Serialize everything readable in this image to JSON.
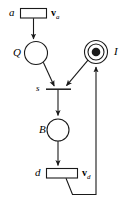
{
  "figure": {
    "type": "petri-net",
    "width": 132,
    "height": 205,
    "background_color": "#ffffff",
    "stroke_color": "#1a1a1a"
  },
  "labels": {
    "arrival_transition": "a",
    "arrival_rate_vector": "v",
    "arrival_rate_subscript": "a",
    "queue_place": "Q",
    "idle_place": "I",
    "service_transition": "s",
    "busy_place": "B",
    "departure_transition": "d",
    "departure_rate_vector": "v",
    "departure_rate_subscript": "d"
  },
  "nodes": {
    "places": [
      {
        "id": "Q",
        "label": "Q",
        "cx": 36,
        "cy": 53,
        "r": 11.5,
        "tokens": 0,
        "double": false
      },
      {
        "id": "I",
        "label": "I",
        "cx": 96,
        "cy": 52,
        "r": 11.5,
        "tokens": 1,
        "double": true
      },
      {
        "id": "B",
        "label": "B",
        "cx": 58,
        "cy": 130,
        "r": 11.0,
        "tokens": 0,
        "double": false
      }
    ],
    "transitions": [
      {
        "id": "a",
        "label": "a",
        "kind": "box",
        "x": 20,
        "y": 8,
        "w": 27,
        "h": 10
      },
      {
        "id": "s",
        "label": "s",
        "kind": "bar",
        "x": 46,
        "y": 89,
        "w": 25,
        "h": 1
      },
      {
        "id": "d",
        "label": "d",
        "kind": "box",
        "x": 46,
        "y": 168,
        "w": 32,
        "h": 10
      }
    ]
  },
  "arcs": [
    {
      "from": "a",
      "to": "Q",
      "kind": "straight"
    },
    {
      "from": "Q",
      "to": "s",
      "kind": "straight"
    },
    {
      "from": "I",
      "to": "s",
      "kind": "straight"
    },
    {
      "from": "s",
      "to": "B",
      "kind": "straight"
    },
    {
      "from": "B",
      "to": "d",
      "kind": "straight"
    },
    {
      "from": "d",
      "to": "I",
      "kind": "polyline-feedback"
    }
  ],
  "tokens": {
    "idle_place_token_count": 1
  }
}
